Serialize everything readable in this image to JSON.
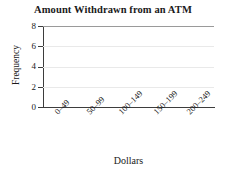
{
  "chart_data": {
    "type": "bar",
    "title": "Amount Withdrawn from an ATM",
    "xlabel": "Dollars",
    "ylabel": "Frequency",
    "categories": [
      "0–49",
      "50–99",
      "100–149",
      "150–199",
      "200–249"
    ],
    "values": [
      0,
      0,
      0,
      0,
      0
    ],
    "ylim": [
      0,
      8
    ],
    "yticks": [
      0,
      2,
      4,
      6,
      8
    ],
    "ytick_labels": [
      "0",
      "2",
      "4",
      "6",
      "8"
    ],
    "grid": true,
    "grid_axis": "y",
    "legend": null,
    "note": "Blank template grid — axes and labels drawn, no bars plotted",
    "colors": {
      "background": "#ffffff",
      "text": "#1a1a1a",
      "axis": "#3d3d3d",
      "gridline": "#e9e9e9",
      "top_rule": "#9a9a9a"
    }
  },
  "axes": {
    "y_ticks": [
      {
        "label": "8",
        "top": 22
      },
      {
        "label": "6",
        "top": 42
      },
      {
        "label": "4",
        "top": 62
      },
      {
        "label": "2",
        "top": 83
      },
      {
        "label": "0",
        "top": 103
      }
    ],
    "y_gridlines": [
      {
        "value": 8,
        "top": 0,
        "rule": true
      },
      {
        "value": 6,
        "top": 20,
        "rule": false
      },
      {
        "value": 4,
        "top": 41,
        "rule": false
      },
      {
        "value": 2,
        "top": 61,
        "rule": false
      }
    ],
    "x_ticks": [
      {
        "label": "0–49",
        "left": 53
      },
      {
        "label": "50–99",
        "left": 85
      },
      {
        "label": "100–149",
        "left": 117
      },
      {
        "label": "150–199",
        "left": 152
      },
      {
        "label": "200–249",
        "left": 185
      }
    ]
  }
}
